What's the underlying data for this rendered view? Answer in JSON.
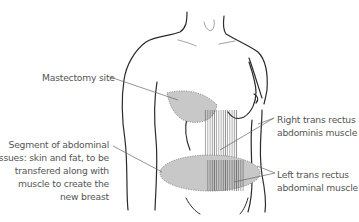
{
  "diagram": {
    "labels": {
      "mastectomy": "Mastectomy site",
      "segment": [
        "Segment of abdominal",
        "tissues: skin and fat, to be",
        "transfered along with",
        "muscle to create the",
        "new breast"
      ],
      "right_muscle": [
        "Right trans rectus",
        "abdominis muscle"
      ],
      "left_muscle": [
        "Left trans rectus",
        "abdominal muscle"
      ]
    },
    "colors": {
      "outline": "#2a2a2a",
      "shading": "#c8c8c8",
      "text": "#555555",
      "leader": "#666666"
    }
  }
}
